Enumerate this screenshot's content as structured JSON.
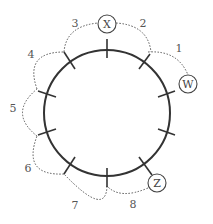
{
  "diagram": {
    "colors": {
      "stroke": "#333333",
      "dotted": "#555555",
      "text": "#444444",
      "background": "#ffffff"
    },
    "nodes": [
      {
        "id": "X",
        "label": "X"
      },
      {
        "id": "W",
        "label": "W"
      },
      {
        "id": "Z",
        "label": "Z"
      }
    ],
    "segments": [
      {
        "label": "1"
      },
      {
        "label": "2"
      },
      {
        "label": "3"
      },
      {
        "label": "4"
      },
      {
        "label": "5"
      },
      {
        "label": "6"
      },
      {
        "label": "7"
      },
      {
        "label": "8"
      }
    ],
    "tick_count": 10
  }
}
